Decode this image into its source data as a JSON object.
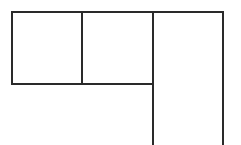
{
  "diagram": {
    "type": "line-outline",
    "stroke_color": "#2a2a2a",
    "stroke_width": 2,
    "background": "#ffffff",
    "cells": [
      {
        "name": "top-left-cell",
        "x": 12,
        "y": 12,
        "w": 70,
        "h": 72
      },
      {
        "name": "top-middle-cell",
        "x": 82,
        "y": 12,
        "w": 71,
        "h": 72
      },
      {
        "name": "right-tall-cell",
        "x": 153,
        "y": 12,
        "w": 70,
        "h": 133
      }
    ]
  }
}
